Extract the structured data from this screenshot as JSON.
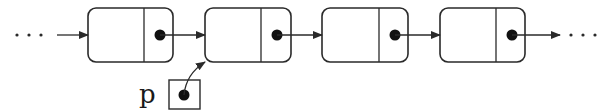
{
  "diagram": {
    "type": "linked-list",
    "colors": {
      "stroke": "#2a2a2a",
      "dot": "#111111",
      "background": "#ffffff"
    },
    "leading_ellipsis": "...",
    "trailing_ellipsis": "...",
    "nodes": [
      {
        "id": "node-1",
        "x": 88,
        "y": 8,
        "w": 85,
        "h": 54,
        "divider_x": 144,
        "dot_x": 160
      },
      {
        "id": "node-2",
        "x": 205,
        "y": 8,
        "w": 86,
        "h": 54,
        "divider_x": 261,
        "dot_x": 277
      },
      {
        "id": "node-3",
        "x": 322,
        "y": 8,
        "w": 86,
        "h": 54,
        "divider_x": 379,
        "dot_x": 395
      },
      {
        "id": "node-4",
        "x": 440,
        "y": 8,
        "w": 85,
        "h": 54,
        "divider_x": 496,
        "dot_x": 512
      }
    ],
    "pointer": {
      "label": "p",
      "box": {
        "x": 169,
        "y": 80,
        "w": 31,
        "h": 29
      },
      "target": "node-2"
    }
  }
}
